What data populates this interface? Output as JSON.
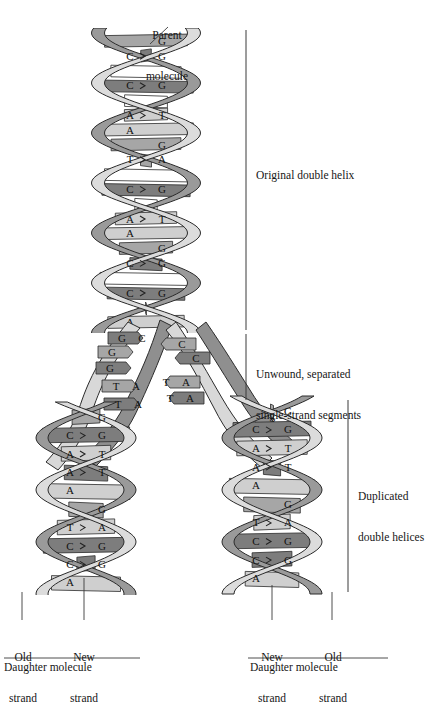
{
  "figure": {
    "title_label": "Parent\nmolecule",
    "parent_label_line1": "Parent",
    "parent_label_line2": "molecule"
  },
  "brackets": [
    {
      "name": "original-double-helix",
      "label": "Original double helix",
      "x": 246,
      "y1": 30,
      "y2": 330,
      "text_x": 256,
      "text_y": 176
    },
    {
      "name": "unwound-segments",
      "label_line1": "Unwound, separated",
      "label_line2": "single-strand segments",
      "x": 246,
      "y1": 334,
      "y2": 400,
      "text_x": 256,
      "text_y": 348
    },
    {
      "name": "duplicated-double-helices",
      "label_line1": "Duplicated",
      "label_line2": "double helices",
      "x": 348,
      "y1": 400,
      "y2": 592,
      "text_x": 358,
      "text_y": 470
    }
  ],
  "bottom_labels": {
    "left_molecule": {
      "old_strand_line1": "Old",
      "old_strand_line2": "strand",
      "new_strand_line1": "New",
      "new_strand_line2": "strand",
      "molecule": "Daughter molecule"
    },
    "right_molecule": {
      "new_strand_line1": "New",
      "new_strand_line2": "strand",
      "old_strand_line1": "Old",
      "old_strand_line2": "strand",
      "molecule": "Daughter molecule"
    }
  },
  "colors": {
    "dark_rung": "#7d7d7d",
    "mid_rung": "#a6a6a6",
    "light_rung": "#cfcfcf",
    "white_rung": "#ffffff",
    "ribbon_light": "#d8d8d8",
    "ribbon_dark": "#8f8f8f",
    "outline": "#2b2b2b",
    "text": "#161616"
  },
  "parent_helix": {
    "name": "parent-double-helix",
    "turns": [
      {
        "rungs": [
          {
            "left": "",
            "right": "G",
            "tone": "mid"
          },
          {
            "left": "C",
            "right": "G",
            "tone": "dark"
          },
          {
            "left": "",
            "right": "",
            "tone": "white"
          },
          {
            "left": "C",
            "right": "G",
            "tone": "dark"
          },
          {
            "left": "",
            "right": "",
            "tone": "white"
          },
          {
            "left": "A",
            "right": "T",
            "tone": "light"
          },
          {
            "left": "A",
            "right": "",
            "tone": "light"
          }
        ]
      },
      {
        "rungs": [
          {
            "left": "",
            "right": "G",
            "tone": "mid"
          },
          {
            "left": "T",
            "right": "A",
            "tone": "mid"
          },
          {
            "left": "",
            "right": "",
            "tone": "white"
          },
          {
            "left": "C",
            "right": "G",
            "tone": "dark"
          },
          {
            "left": "",
            "right": "",
            "tone": "white"
          },
          {
            "left": "A",
            "right": "T",
            "tone": "light"
          },
          {
            "left": "A",
            "right": "",
            "tone": "light"
          }
        ]
      },
      {
        "rungs": [
          {
            "left": "",
            "right": "G",
            "tone": "mid"
          },
          {
            "left": "C",
            "right": "G",
            "tone": "dark"
          },
          {
            "left": "",
            "right": "",
            "tone": "white"
          },
          {
            "left": "C",
            "right": "G",
            "tone": "dark"
          },
          {
            "left": "",
            "right": "",
            "tone": "white"
          },
          {
            "left": "A",
            "right": "",
            "tone": "light"
          }
        ]
      }
    ]
  },
  "fork": {
    "name": "replication-fork",
    "left_bases": [
      "G",
      "G",
      "G",
      "T",
      "T"
    ],
    "left_pairs": [
      "C",
      "",
      "",
      "A",
      "A"
    ],
    "right_bases": [
      "C",
      "C",
      "A",
      "A"
    ],
    "right_pairs": [
      "",
      "",
      "T",
      "T"
    ]
  },
  "left_daughter": {
    "name": "left-daughter-helix",
    "rungs": [
      {
        "left": "",
        "right": "G",
        "tone": "mid"
      },
      {
        "left": "C",
        "right": "G",
        "tone": "dark"
      },
      {
        "left": "A",
        "right": "T",
        "tone": "light"
      },
      {
        "left": "A",
        "right": "T",
        "tone": "dark"
      },
      {
        "left": "A",
        "right": "",
        "tone": "light"
      },
      {
        "left": "",
        "right": "G",
        "tone": "mid"
      },
      {
        "left": "T",
        "right": "A",
        "tone": "light"
      },
      {
        "left": "C",
        "right": "G",
        "tone": "dark"
      },
      {
        "left": "C",
        "right": "G",
        "tone": "dark"
      },
      {
        "left": "A",
        "right": "",
        "tone": "light"
      }
    ]
  },
  "right_daughter": {
    "name": "right-daughter-helix",
    "rungs": [
      {
        "left": "",
        "right": "G",
        "tone": "mid"
      },
      {
        "left": "C",
        "right": "G",
        "tone": "dark"
      },
      {
        "left": "A",
        "right": "T",
        "tone": "light"
      },
      {
        "left": "A",
        "right": "T",
        "tone": "dark"
      },
      {
        "left": "A",
        "right": "",
        "tone": "light"
      },
      {
        "left": "",
        "right": "G",
        "tone": "mid"
      },
      {
        "left": "T",
        "right": "A",
        "tone": "light"
      },
      {
        "left": "C",
        "right": "G",
        "tone": "dark"
      },
      {
        "left": "C",
        "right": "G",
        "tone": "dark"
      },
      {
        "left": "A",
        "right": "",
        "tone": "light"
      }
    ]
  }
}
